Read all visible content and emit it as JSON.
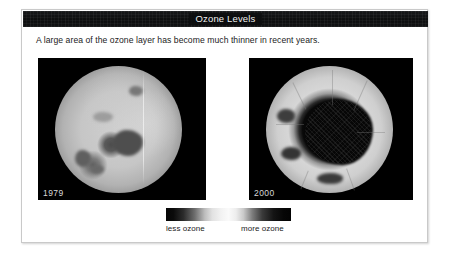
{
  "window": {
    "title": "Ozone Levels"
  },
  "body": {
    "caption": "A large area of the ozone layer has become much thinner in recent years."
  },
  "figures": [
    {
      "year_label": "1979",
      "alt": "satellite ozone map 1979"
    },
    {
      "year_label": "2000",
      "alt": "satellite ozone map 2000"
    }
  ],
  "legend": {
    "low_label": "less ozone",
    "high_label": "more ozone"
  },
  "colors": {
    "titlebar": "#0c0d0e",
    "title_text": "#f2f2f2",
    "card_background": "#ffffff",
    "card_border": "#c9c9c9",
    "panel_background": "#000000",
    "text": "#1b1b1b",
    "year_label": "#d8d8d8"
  }
}
